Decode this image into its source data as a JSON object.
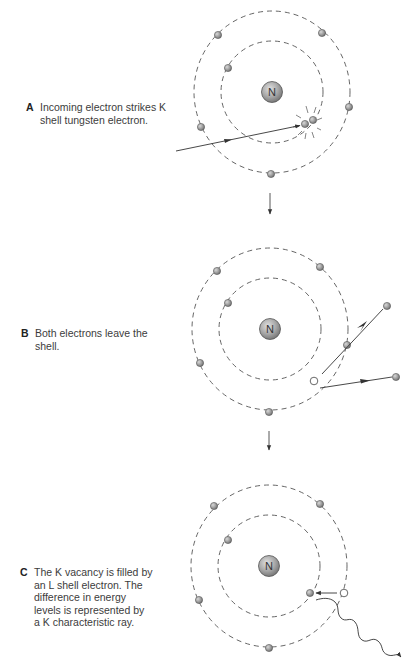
{
  "figure": {
    "panels": [
      {
        "letter": "A",
        "caption": "Incoming electron strikes K shell tungsten electron.",
        "caption_lines": [
          "Incoming electron strikes K",
          "shell tungsten electron."
        ],
        "nucleus_label": "N"
      },
      {
        "letter": "B",
        "caption": "Both electrons leave the shell.",
        "caption_lines": [
          "Both electrons leave the",
          "shell."
        ],
        "nucleus_label": "N"
      },
      {
        "letter": "C",
        "caption": "The K vacancy is filled by an L shell electron. The difference in energy levels is represented by a K characteristic ray.",
        "caption_lines": [
          "The K vacancy is filled by",
          "an L shell electron. The",
          "difference in energy",
          "levels is represented by",
          "a K characteristic ray."
        ],
        "nucleus_label": "N"
      }
    ],
    "colors": {
      "electron_fill": "#9a9a9a",
      "electron_stroke": "#555555",
      "shell_stroke": "#555555",
      "line_stroke": "#333333",
      "vacancy_fill": "#ffffff"
    }
  }
}
